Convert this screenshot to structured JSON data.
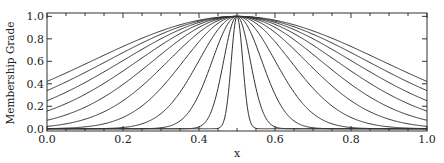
{
  "chart_data": {
    "type": "line",
    "title": "",
    "xlabel": "x",
    "ylabel": "Membership Grade",
    "xlim": [
      0.0,
      1.0
    ],
    "ylim": [
      -0.02,
      1.03
    ],
    "grid": false,
    "legend": null,
    "x_ticks": [
      "0.0",
      "0.2",
      "0.4",
      "0.6",
      "0.8",
      "1.0"
    ],
    "y_ticks": [
      "0.0",
      "0.2",
      "0.4",
      "0.6",
      "0.8",
      "1.0"
    ],
    "curve_family": "gaussian membership functions centered at x = 0.5 with decreasing width",
    "center": 0.5,
    "series": [
      {
        "name": "sigma=0.38",
        "sigma": 0.38,
        "value_at_0": 0.42
      },
      {
        "name": "sigma=0.34",
        "sigma": 0.34,
        "value_at_0": 0.34
      },
      {
        "name": "sigma=0.30",
        "sigma": 0.3,
        "value_at_0": 0.25
      },
      {
        "name": "sigma=0.26",
        "sigma": 0.26,
        "value_at_0": 0.16
      },
      {
        "name": "sigma=0.22",
        "sigma": 0.22,
        "value_at_0": 0.08
      },
      {
        "name": "sigma=0.18",
        "sigma": 0.18,
        "value_at_0": 0.02
      },
      {
        "name": "sigma=0.14",
        "sigma": 0.14,
        "value_at_0": 0.0
      },
      {
        "name": "sigma=0.10",
        "sigma": 0.1,
        "value_at_0": 0.0
      },
      {
        "name": "sigma=0.065",
        "sigma": 0.065,
        "value_at_0": 0.0
      },
      {
        "name": "sigma=0.035",
        "sigma": 0.035,
        "value_at_0": 0.0
      },
      {
        "name": "sigma=0.015",
        "sigma": 0.015,
        "value_at_0": 0.0
      }
    ]
  },
  "style": {
    "line_color": "#333333",
    "axis_color": "#333333",
    "background": "#ffffff"
  }
}
